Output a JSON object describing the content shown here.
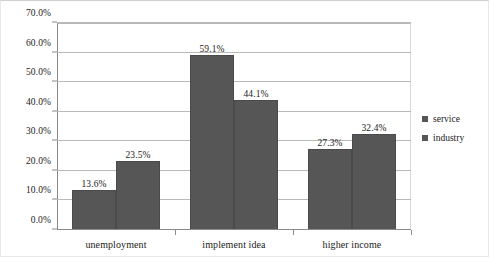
{
  "chart_data": {
    "type": "bar",
    "title": "",
    "xlabel": "",
    "ylabel": "",
    "categories": [
      "unemployment",
      "implement idea",
      "higher income"
    ],
    "series": [
      {
        "name": "service",
        "values": [
          13.6,
          59.1,
          27.3
        ]
      },
      {
        "name": "industry",
        "values": [
          23.5,
          44.1,
          32.4
        ]
      }
    ],
    "value_labels": [
      [
        "13.6%",
        "23.5%"
      ],
      [
        "59.1%",
        "44.1%"
      ],
      [
        "27.3%",
        "32.4%"
      ]
    ],
    "ylim": [
      0,
      70
    ],
    "ytick_values": [
      0,
      10,
      20,
      30,
      40,
      50,
      60,
      70
    ],
    "ytick_labels": [
      "0.0%",
      "10.0%",
      "20.0%",
      "30.0%",
      "40.0%",
      "50.0%",
      "60.0%",
      "70.0%"
    ],
    "grid": true,
    "legend_position": "right",
    "colors": {
      "service": "#565656",
      "industry": "#565656",
      "gridline": "#b9b9b9",
      "axis": "#8a8a8a",
      "background": "#ffffff",
      "text": "#1a1a1a"
    }
  }
}
